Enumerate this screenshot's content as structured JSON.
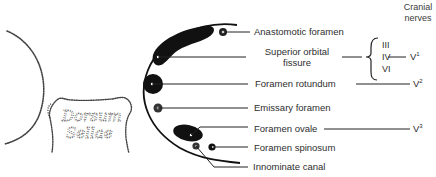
{
  "diagram": {
    "type": "anatomical-foramina-of-middle-cranial-fossa",
    "header": {
      "line1": "Cranial",
      "line2": "nerves"
    },
    "structures": {
      "dorsum_sellae": {
        "line1": "Dorsum",
        "line2": "Sellae"
      }
    },
    "labels": [
      {
        "id": "anastomotic",
        "text": "Anastomotic foramen"
      },
      {
        "id": "sof_line1",
        "text": "Superior orbital"
      },
      {
        "id": "sof_line2",
        "text": "fissure"
      },
      {
        "id": "rotundum",
        "text": "Foramen rotundum"
      },
      {
        "id": "emissary",
        "text": "Emissary foramen"
      },
      {
        "id": "ovale",
        "text": "Foramen ovale"
      },
      {
        "id": "spinosum",
        "text": "Foramen spinosum"
      },
      {
        "id": "innominate",
        "text": "Innominate canal"
      }
    ],
    "nerves": {
      "sof_group": [
        "III",
        "IV",
        "VI"
      ],
      "v1": {
        "base": "V",
        "sup": "1"
      },
      "v2": {
        "base": "V",
        "sup": "2"
      },
      "v3": {
        "base": "V",
        "sup": "3"
      }
    },
    "colors": {
      "ink": "#111111",
      "line": "#2a2a2a",
      "dotted": "#555555",
      "background": "#ffffff"
    }
  }
}
